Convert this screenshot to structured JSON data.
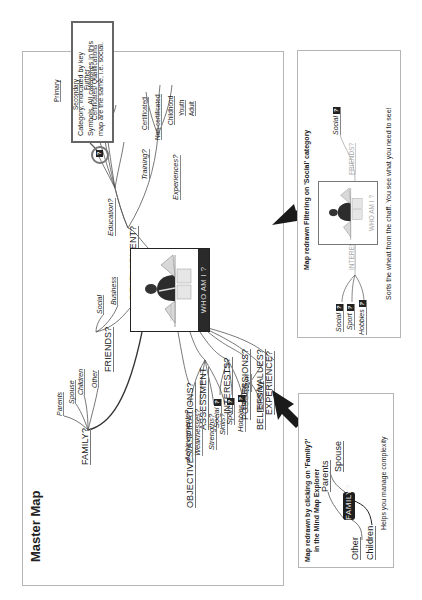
{
  "master_map": {
    "title": "Master Map",
    "center": {
      "label": "WHO AM I ?",
      "image": "person-reading-books"
    },
    "callout": "Category, indicated by key Symbols. All categories in this map are the same, i.e. social.",
    "branches": {
      "family": {
        "label": "FAMILY?",
        "children": [
          "Parents",
          "Spouse",
          "Children",
          "Other"
        ]
      },
      "friends": {
        "label": "FRIENDS?",
        "children": [
          "Social",
          "Business"
        ]
      },
      "development": {
        "label": "DEVELOPMENT?",
        "education": {
          "label": "Education?",
          "children": [
            "Primary",
            "Secondary",
            "Further",
            "Certificates/ Qualifications"
          ]
        },
        "training": {
          "label": "Training?",
          "children": [
            "Certificated",
            "Non-certificated"
          ]
        },
        "experiences": {
          "label": "Experiences?",
          "children": [
            "Childhood",
            "Youth",
            "Adult"
          ]
        }
      },
      "objectives": {
        "label": "OBJECTIVES/ASPIRATIONS?"
      },
      "assessment": {
        "label": "ASSESSMENT",
        "children": [
          "Achievements?",
          "Weaknesses?",
          "Strengths?",
          "Skills?"
        ]
      },
      "interests": {
        "label": "INTERESTS?",
        "children": [
          "Social",
          "Sport",
          "Hobbies"
        ]
      },
      "possessions": {
        "label": "POSSESSIONS?"
      },
      "beliefs": {
        "label": "BELIEFS/VALUES?"
      },
      "experience": {
        "label": "EXPERIENCE?",
        "work": {
          "label": "Work",
          "children": [
            "Full Time",
            "Temporary"
          ]
        }
      }
    },
    "key_symbol": "?"
  },
  "family_panel": {
    "caption_line1": "Map redrawn by clicking on 'Family?'",
    "caption_line2": "in the Mind Map Explorer",
    "center": "FAMILY?",
    "children": [
      "Parents",
      "Spouse",
      "Other",
      "Children"
    ],
    "note": "Helps you manage complexity"
  },
  "social_panel": {
    "caption": "Map redrawn Filtering on 'Social' category",
    "center": "WHO AM I ?",
    "interests": {
      "label": "INTERESTS?",
      "children": [
        "Social",
        "Sport",
        "Hobbies"
      ]
    },
    "friends": {
      "label": "FRIENDS?",
      "children": [
        "Social"
      ]
    },
    "note": "Sorts the wheat from the chaff. You see what you need to see!"
  },
  "colors": {
    "line": "#555555",
    "dark_node": "#1e1e1e",
    "border": "#b5b5b5",
    "faded": "#aaaaaa"
  }
}
